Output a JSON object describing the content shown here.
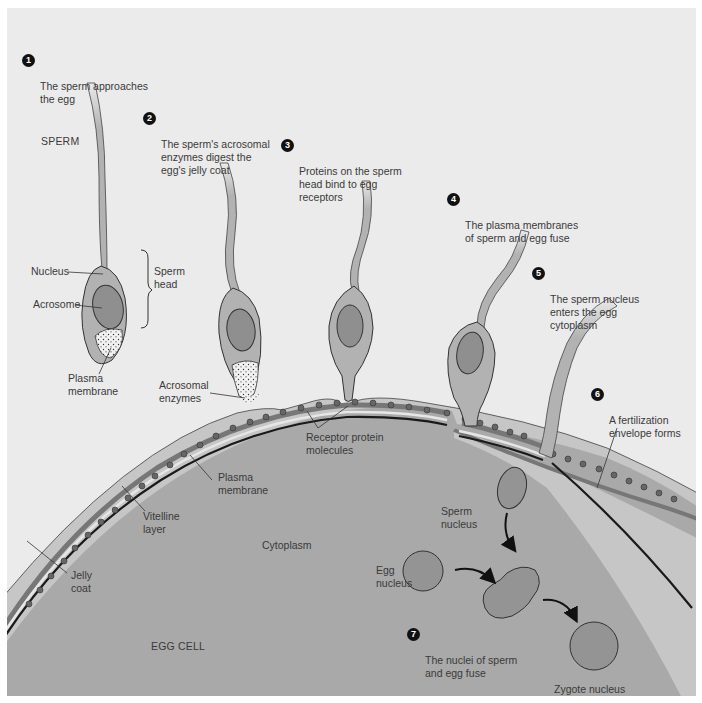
{
  "diagram": {
    "colors": {
      "background": "#ebebeb",
      "jelly_coat": "#c6c6c6",
      "egg_cytoplasm": "#a9a9a9",
      "sperm_body": "#b2b2b2",
      "sperm_nucleus": "#8f8f8f",
      "vitelline_layer": "#777777",
      "plasma_membrane": "#1a1a1a",
      "step_badge": "#111111"
    },
    "steps": [
      {
        "num": "1",
        "text": "The sperm approaches\nthe egg"
      },
      {
        "num": "2",
        "text": "The sperm's acrosomal\nenzymes digest the\negg's jelly coat"
      },
      {
        "num": "3",
        "text": "Proteins on the sperm\nhead bind to egg\nreceptors"
      },
      {
        "num": "4",
        "text": "The plasma membranes\nof sperm and egg fuse"
      },
      {
        "num": "5",
        "text": "The sperm nucleus\nenters the egg\ncytoplasm"
      },
      {
        "num": "6",
        "text": "A fertilization\nenvelope forms"
      },
      {
        "num": "7",
        "text": "The nuclei of sperm\nand egg fuse"
      }
    ],
    "labels": {
      "sperm": "SPERM",
      "nucleus": "Nucleus",
      "acrosome": "Acrosome",
      "sperm_head": "Sperm\nhead",
      "plasma_membrane_sperm": "Plasma\nmembrane",
      "acrosomal_enzymes": "Acrosomal\nenzymes",
      "receptor_protein_molecules": "Receptor protein\nmolecules",
      "plasma_membrane_egg": "Plasma\nmembrane",
      "vitelline_layer": "Vitelline\nlayer",
      "jelly_coat": "Jelly\ncoat",
      "cytoplasm": "Cytoplasm",
      "egg_cell": "EGG CELL",
      "sperm_nucleus": "Sperm\nnucleus",
      "egg_nucleus": "Egg\nnucleus",
      "zygote_nucleus": "Zygote nucleus"
    }
  }
}
